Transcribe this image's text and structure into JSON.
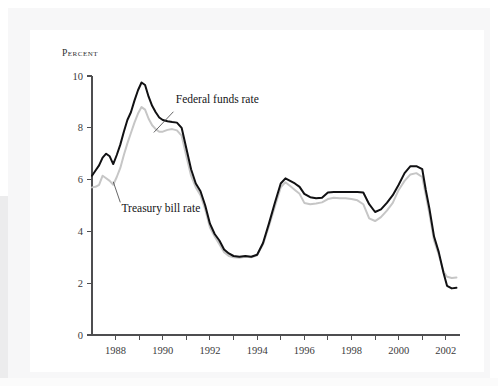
{
  "figure": {
    "panel_background": "#ffffff",
    "frame_background": "#f7f7f8"
  },
  "chart_data": {
    "type": "line",
    "title": "",
    "subtitle": "",
    "xlabel": "",
    "ylabel": "Percent",
    "ylabel_display": "Percent",
    "xlim": [
      1987.0,
      2002.6
    ],
    "ylim": [
      0,
      10
    ],
    "grid": false,
    "legend_position": "inline-annotations",
    "y_ticks": [
      0,
      2,
      4,
      6,
      8,
      10
    ],
    "y_tick_labels": [
      "0",
      "2",
      "4",
      "6",
      "8",
      "10"
    ],
    "x_ticks": [
      1988,
      1989,
      1990,
      1991,
      1992,
      1993,
      1994,
      1995,
      1996,
      1997,
      1998,
      1999,
      2000,
      2001,
      2002
    ],
    "x_tick_labels_shown": [
      "1988",
      "1990",
      "1992",
      "1994",
      "1996",
      "1998",
      "2000",
      "2002"
    ],
    "x_tick_labeled_values": [
      1988,
      1990,
      1992,
      1994,
      1996,
      1998,
      2000,
      2002
    ],
    "annotations": [
      {
        "name": "federal-funds-rate-label",
        "text": "Federal funds rate",
        "text_x": 1990.55,
        "text_y": 8.95,
        "leader_from_x": 1990.45,
        "leader_from_y": 8.62,
        "leader_to_x": 1989.62,
        "leader_to_y": 7.82
      },
      {
        "name": "treasury-bill-rate-label",
        "text": "Treasury bill rate",
        "text_x": 1988.25,
        "text_y": 4.75,
        "leader_from_x": 1988.2,
        "leader_from_y": 5.12,
        "leader_to_x": 1987.9,
        "leader_to_y": 5.92
      }
    ],
    "series": [
      {
        "name": "Federal funds rate",
        "color": "#111113",
        "x": [
          1987.0,
          1987.15,
          1987.3,
          1987.45,
          1987.6,
          1987.75,
          1987.9,
          1988.05,
          1988.2,
          1988.35,
          1988.5,
          1988.65,
          1988.8,
          1988.95,
          1989.1,
          1989.25,
          1989.4,
          1989.55,
          1989.7,
          1989.85,
          1990.0,
          1990.2,
          1990.4,
          1990.6,
          1990.8,
          1991.0,
          1991.2,
          1991.4,
          1991.6,
          1991.8,
          1992.0,
          1992.2,
          1992.4,
          1992.6,
          1992.8,
          1993.0,
          1993.25,
          1993.5,
          1993.75,
          1994.0,
          1994.25,
          1994.5,
          1994.75,
          1995.0,
          1995.2,
          1995.4,
          1995.6,
          1995.8,
          1996.0,
          1996.25,
          1996.5,
          1996.75,
          1997.0,
          1997.25,
          1997.5,
          1997.75,
          1998.0,
          1998.25,
          1998.5,
          1998.75,
          1999.0,
          1999.25,
          1999.5,
          1999.75,
          2000.0,
          2000.25,
          2000.5,
          2000.75,
          2001.0,
          2001.15,
          2001.3,
          2001.5,
          2001.7,
          2001.9,
          2002.05,
          2002.25,
          2002.45
        ],
        "values": [
          6.15,
          6.35,
          6.55,
          6.85,
          7.0,
          6.9,
          6.6,
          6.95,
          7.35,
          7.85,
          8.3,
          8.6,
          9.05,
          9.45,
          9.75,
          9.65,
          9.2,
          8.85,
          8.6,
          8.4,
          8.3,
          8.25,
          8.22,
          8.2,
          8.0,
          7.2,
          6.4,
          5.85,
          5.55,
          5.0,
          4.3,
          3.9,
          3.65,
          3.3,
          3.15,
          3.05,
          3.02,
          3.05,
          3.02,
          3.1,
          3.55,
          4.3,
          5.1,
          5.85,
          6.05,
          5.95,
          5.85,
          5.72,
          5.45,
          5.32,
          5.28,
          5.3,
          5.5,
          5.52,
          5.52,
          5.52,
          5.52,
          5.52,
          5.5,
          5.05,
          4.75,
          4.85,
          5.1,
          5.4,
          5.8,
          6.25,
          6.52,
          6.52,
          6.4,
          5.6,
          4.9,
          3.8,
          3.2,
          2.4,
          1.9,
          1.8,
          1.82
        ]
      },
      {
        "name": "Treasury bill rate",
        "color": "#c6c6c6",
        "x": [
          1987.0,
          1987.15,
          1987.3,
          1987.45,
          1987.6,
          1987.75,
          1987.9,
          1988.05,
          1988.2,
          1988.35,
          1988.5,
          1988.65,
          1988.8,
          1988.95,
          1989.1,
          1989.25,
          1989.4,
          1989.55,
          1989.7,
          1989.85,
          1990.0,
          1990.2,
          1990.4,
          1990.6,
          1990.8,
          1991.0,
          1991.2,
          1991.4,
          1991.6,
          1991.8,
          1992.0,
          1992.2,
          1992.4,
          1992.6,
          1992.8,
          1993.0,
          1993.25,
          1993.5,
          1993.75,
          1994.0,
          1994.25,
          1994.5,
          1994.75,
          1995.0,
          1995.2,
          1995.4,
          1995.6,
          1995.8,
          1996.0,
          1996.25,
          1996.5,
          1996.75,
          1997.0,
          1997.25,
          1997.5,
          1997.75,
          1998.0,
          1998.25,
          1998.5,
          1998.75,
          1999.0,
          1999.25,
          1999.5,
          1999.75,
          2000.0,
          2000.25,
          2000.5,
          2000.75,
          2001.0,
          2001.15,
          2001.3,
          2001.5,
          2001.7,
          2001.9,
          2002.05,
          2002.25,
          2002.45
        ],
        "values": [
          5.7,
          5.72,
          5.8,
          6.15,
          6.05,
          5.95,
          5.8,
          6.1,
          6.45,
          6.95,
          7.4,
          7.8,
          8.2,
          8.55,
          8.8,
          8.7,
          8.35,
          8.1,
          7.95,
          7.85,
          7.85,
          7.92,
          7.95,
          7.9,
          7.7,
          6.9,
          6.15,
          5.7,
          5.4,
          4.85,
          4.15,
          3.8,
          3.5,
          3.2,
          3.05,
          3.0,
          2.98,
          3.02,
          3.0,
          3.08,
          3.5,
          4.2,
          4.95,
          5.7,
          5.9,
          5.75,
          5.6,
          5.45,
          5.1,
          5.05,
          5.08,
          5.12,
          5.25,
          5.3,
          5.28,
          5.28,
          5.25,
          5.2,
          5.05,
          4.5,
          4.4,
          4.55,
          4.8,
          5.1,
          5.6,
          5.95,
          6.2,
          6.25,
          6.1,
          5.4,
          4.7,
          3.65,
          3.1,
          2.45,
          2.25,
          2.2,
          2.22
        ]
      }
    ]
  }
}
